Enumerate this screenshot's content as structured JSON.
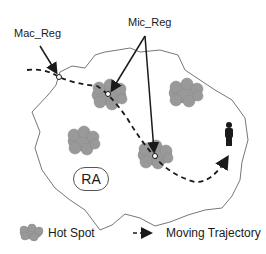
{
  "diagram": {
    "labels": {
      "mac_reg": "Mac_Reg",
      "mic_reg": "Mic_Reg",
      "ra": "RA"
    },
    "legend": {
      "hot_spot": "Hot Spot",
      "moving_trajectory": "Moving Trajectory"
    },
    "colors": {
      "hot_spot_fill": "#999999",
      "region_border": "#777777",
      "trajectory": "#1a1a1a"
    }
  }
}
